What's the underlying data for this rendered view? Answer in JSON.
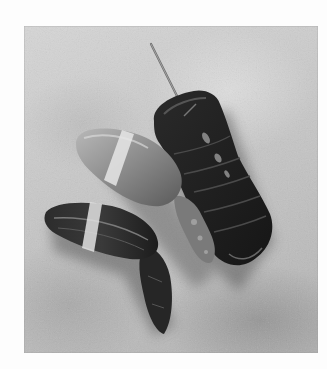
{
  "image": {
    "description": "Black-and-white photograph of lobster parts on a mottled stone surface",
    "subjects": [
      {
        "name": "lobster-tail",
        "note": "dark segmented tail with a thin skewer inserted at top"
      },
      {
        "name": "lobster-claw-light",
        "note": "pale claw with a rubber band, upper center-left"
      },
      {
        "name": "lobster-claw-dark",
        "note": "dark claw with a rubber band and knuckle, lower left"
      }
    ],
    "colors": {
      "border": "#fdfdfd",
      "background_surface": "#c4c4c4",
      "tail": "#1e1e1e",
      "claw_light": "#8f8f8f",
      "claw_dark": "#262626",
      "band": "#e6e6e6"
    }
  }
}
